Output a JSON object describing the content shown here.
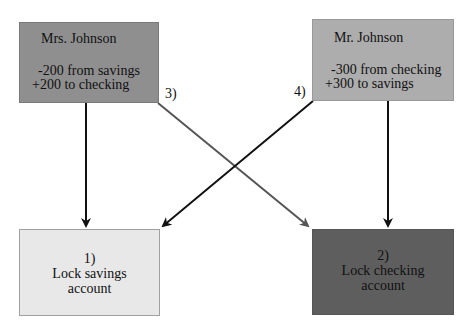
{
  "nodes": {
    "mrs_johnson": {
      "title": "Mrs.  Johnson",
      "line1": "-200 from savings",
      "line2": "+200 to checking",
      "color": "#8f8f8f"
    },
    "mr_johnson": {
      "title": "Mr.  Johnson",
      "line1": "-300 from checking",
      "line2": "+300 to savings",
      "color": "#adadad"
    },
    "lock_savings": {
      "step": "1)",
      "line1": "Lock savings",
      "line2": "account",
      "color": "#e8e8e8"
    },
    "lock_checking": {
      "step": "2)",
      "line1": "Lock checking",
      "line2": "account",
      "color": "#5e5e5e"
    }
  },
  "edge_labels": {
    "step3": "3)",
    "step4": "4)"
  },
  "edges": [
    {
      "from": "mrs_johnson",
      "to": "lock_savings",
      "color": "#111111"
    },
    {
      "from": "mrs_johnson",
      "to": "lock_checking",
      "label": "3)",
      "color": "#555555"
    },
    {
      "from": "mr_johnson",
      "to": "lock_savings",
      "label": "4)",
      "color": "#111111"
    },
    {
      "from": "mr_johnson",
      "to": "lock_checking",
      "color": "#111111"
    }
  ]
}
